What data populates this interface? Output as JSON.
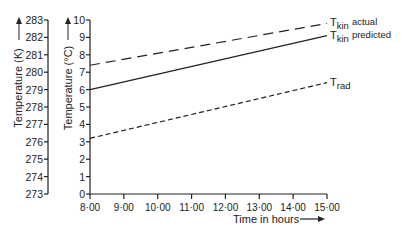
{
  "chart_data": {
    "type": "line",
    "title": "",
    "xlabel": "Time in hours",
    "ylabel": "Temperature (°C)",
    "ylabel_secondary": "Temperature (K)",
    "x": [
      "8·00",
      "9·00",
      "10·00",
      "11·00",
      "12·00",
      "13·00",
      "14·00",
      "15·00"
    ],
    "x_ticks": [
      "8·00",
      "9·00",
      "10·00",
      "11·00",
      "12·00",
      "13·00",
      "14·00",
      "15·00"
    ],
    "y_ticks": [
      "0",
      "1",
      "2",
      "3",
      "4",
      "5",
      "6",
      "7",
      "8",
      "9",
      "10"
    ],
    "y2_ticks": [
      "273",
      "274",
      "275",
      "276",
      "277",
      "278",
      "279",
      "280",
      "281",
      "282",
      "283"
    ],
    "ylim": [
      0,
      10
    ],
    "y2lim": [
      273,
      283
    ],
    "grid": false,
    "series": [
      {
        "name": "T_kin actual",
        "label_main": "T",
        "label_sub": "kin",
        "label_suffix": "actual",
        "style": "long-dash",
        "x": [
          8,
          15
        ],
        "values": [
          7.4,
          9.8
        ]
      },
      {
        "name": "T_kin predicted",
        "label_main": "T",
        "label_sub": "kin",
        "label_suffix": "predicted",
        "style": "solid",
        "x": [
          8,
          15
        ],
        "values": [
          6.0,
          9.1
        ]
      },
      {
        "name": "T_rad",
        "label_main": "T",
        "label_sub": "rad",
        "label_suffix": "",
        "style": "short-dash",
        "x": [
          8,
          15
        ],
        "values": [
          3.2,
          6.4
        ]
      }
    ]
  }
}
